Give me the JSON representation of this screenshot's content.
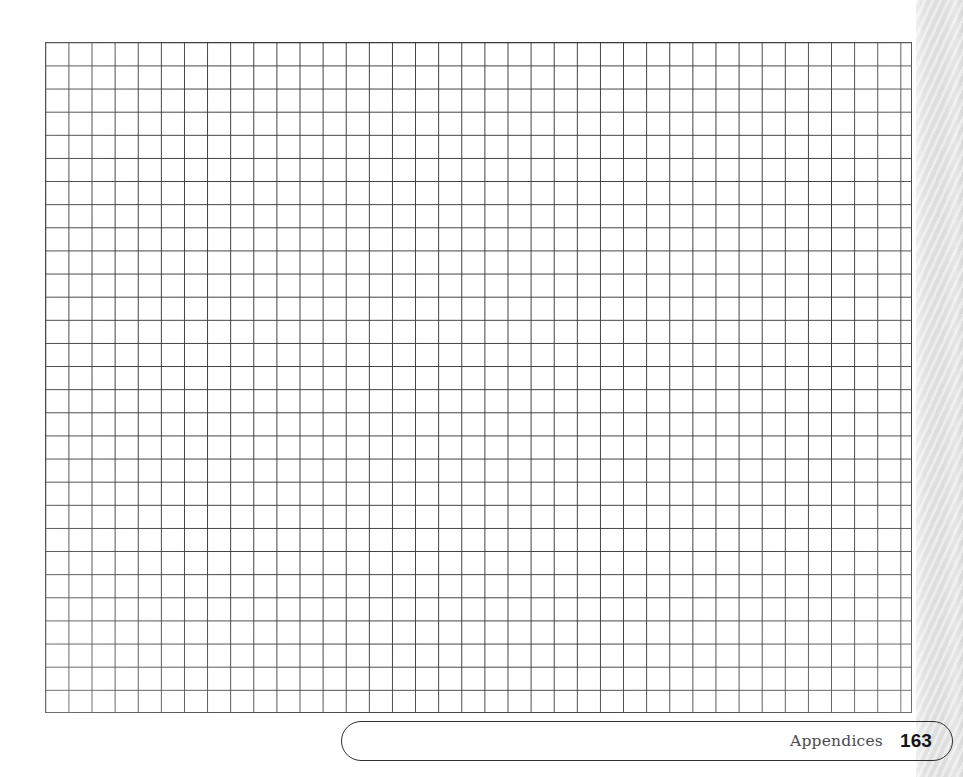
{
  "page": {
    "background_color": "#ffffff",
    "width": 963,
    "height": 777
  },
  "grid": {
    "name": "blank-graph-paper-grid",
    "columns": 37,
    "rows": 29,
    "cell_size_px": 23.1,
    "line_color": "#3c3c3e",
    "border_color": "#38383a",
    "fill_color": "#ffffff",
    "left_px": 45,
    "top_px": 42,
    "width_px": 867,
    "height_px": 671
  },
  "page_edge": {
    "name": "page-edge-strip",
    "color": "#e0e0e0",
    "left_px": 916,
    "width_px": 47
  },
  "footer": {
    "section_label": "Appendices",
    "page_number": "163",
    "border_color": "#2e2e30",
    "shape": "rounded-capsule"
  },
  "chart_data": {
    "type": "table",
    "title": "",
    "subtitle": "",
    "xlabel": "",
    "ylabel": "",
    "grid": true,
    "legend": "none",
    "categories": [],
    "values": []
  }
}
